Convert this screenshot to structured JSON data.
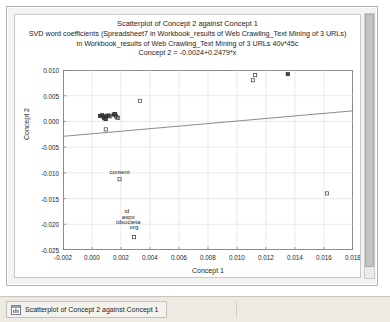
{
  "window": {
    "scrollbar_name": "vertical-scrollbar"
  },
  "titles": {
    "main": "Scatterplot of Concept 2 against Concept 1",
    "sub_line1": "SVD word coefficients (Spreadsheet7 in Workbook_results of Web Crawling_Text Mining of 3 URLs)",
    "sub_line2": "in Workbook_results of Web Crawling_Text Mining of 3 URLs 40v*45c",
    "equation": "Concept 2 = -0.0024+0.2479*x"
  },
  "taskbar": {
    "button_label": "Scatterplot of Concept 2 against Concept 1",
    "icon": "chart-window-icon"
  },
  "chart_data": {
    "type": "scatter",
    "title": "Scatterplot of Concept 2 against Concept 1",
    "subtitle": "SVD word coefficients (Spreadsheet7 in Workbook_results of Web Crawling_Text Mining of 3 URLs) in Workbook_results of Web Crawling_Text Mining of 3 URLs 40v*45c",
    "equation": "Concept 2 = -0.0024+0.2479*x",
    "xlabel": "Concept 1",
    "ylabel": "Concept 2",
    "xlim": [
      -0.002,
      0.018
    ],
    "ylim": [
      -0.025,
      0.01
    ],
    "xticks": [
      -0.002,
      0.0,
      0.002,
      0.004,
      0.006,
      0.008,
      0.01,
      0.012,
      0.014,
      0.016,
      0.018
    ],
    "yticks": [
      0.01,
      0.005,
      0.0,
      -0.005,
      -0.01,
      -0.015,
      -0.02,
      -0.025
    ],
    "xtick_labels": [
      "-0.002",
      "0.000",
      "0.002",
      "0.004",
      "0.006",
      "0.008",
      "0.010",
      "0.012",
      "0.014",
      "0.016",
      "0.018"
    ],
    "ytick_labels": [
      "0.010",
      "0.005",
      "0.000",
      "-0.005",
      "-0.010",
      "-0.015",
      "-0.020",
      "-0.025"
    ],
    "grid": true,
    "legend": "none",
    "fit_line": {
      "intercept": -0.0024,
      "slope": 0.2479,
      "x_start": -0.002,
      "x_end": 0.018,
      "y_start": -0.0029,
      "y_end": 0.00206
    },
    "points": [
      {
        "x": 0.00055,
        "y": 0.00105,
        "marker": "filled"
      },
      {
        "x": 0.0007,
        "y": 0.0012,
        "marker": "filled"
      },
      {
        "x": 0.0008,
        "y": 0.0009,
        "marker": "filled"
      },
      {
        "x": 0.00085,
        "y": 0.0006,
        "marker": "filled"
      },
      {
        "x": 0.00095,
        "y": 0.00045,
        "marker": "filled"
      },
      {
        "x": 0.001,
        "y": 0.0011,
        "marker": "filled"
      },
      {
        "x": 0.00115,
        "y": 0.00115,
        "marker": "filled"
      },
      {
        "x": 0.00125,
        "y": 0.001,
        "marker": "open"
      },
      {
        "x": 0.0015,
        "y": 0.00135,
        "marker": "filled"
      },
      {
        "x": 0.0016,
        "y": 0.0014,
        "marker": "filled"
      },
      {
        "x": 0.00165,
        "y": 0.00105,
        "marker": "open"
      },
      {
        "x": 0.0017,
        "y": 0.0008,
        "marker": "open"
      },
      {
        "x": 0.0018,
        "y": 0.0007,
        "marker": "open"
      },
      {
        "x": 0.00095,
        "y": -0.00155,
        "marker": "open"
      },
      {
        "x": 0.0033,
        "y": 0.004,
        "marker": "open"
      },
      {
        "x": 0.01125,
        "y": 0.009,
        "marker": "open"
      },
      {
        "x": 0.0111,
        "y": 0.008,
        "marker": "open"
      },
      {
        "x": 0.0135,
        "y": 0.0092,
        "marker": "filled"
      },
      {
        "x": 0.0019,
        "y": -0.01125,
        "marker": "open"
      },
      {
        "x": 0.0029,
        "y": -0.0225,
        "marker": "open"
      },
      {
        "x": 0.0162,
        "y": -0.014,
        "marker": "open"
      }
    ],
    "point_labels": [
      {
        "text": "content",
        "x": 0.0019,
        "y": -0.01015
      },
      {
        "text": "id",
        "x": 0.0024,
        "y": -0.0179
      },
      {
        "text": "aspx",
        "x": 0.0025,
        "y": -0.0189
      },
      {
        "text": "idsocieta",
        "x": 0.0025,
        "y": -0.0199
      },
      {
        "text": "org",
        "x": 0.0029,
        "y": -0.0209
      }
    ]
  }
}
